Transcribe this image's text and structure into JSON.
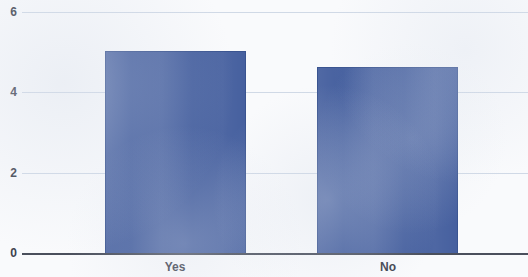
{
  "chart_data": {
    "type": "bar",
    "title": "",
    "subtitle": "",
    "xlabel": "",
    "ylabel": "",
    "categories": [
      "Yes",
      "No"
    ],
    "values": [
      5.05,
      4.65
    ],
    "ylim": [
      0,
      6
    ],
    "yticks": [
      0,
      2,
      4,
      6
    ],
    "ytick_labels": [
      "0",
      "2",
      "4",
      "6"
    ],
    "grid": true,
    "legend": false,
    "legend_position": "none",
    "series": [
      {
        "name": "",
        "values": [
          5.05,
          4.65
        ]
      }
    ]
  },
  "style": {
    "bar_color": "#46609f",
    "bar_border_color": "#3a5490",
    "grid_color": "#c9d2e2",
    "axis_color": "#4a4f5c",
    "tick_text_color": "#3d424e",
    "plot_background": "#f9fafc"
  }
}
